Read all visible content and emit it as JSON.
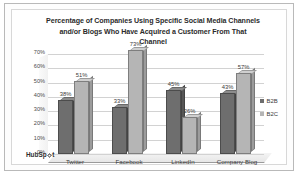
{
  "chart_data": {
    "type": "bar",
    "title": "Percentage of Companies Using Specific Social Media Channels and/or Blogs Who Have Acquired a Customer From That Channel",
    "title_lines": [
      "Percentage of Companies Using Specific Social Media Channels",
      "and/or Blogs Who Have Acquired a Customer From That",
      "Channel"
    ],
    "categories": [
      "Twitter",
      "Facebook",
      "LinkedIn",
      "Company Blog"
    ],
    "series": [
      {
        "name": "B2B",
        "values": [
          38,
          33,
          45,
          43
        ],
        "color": "#6e6e6e"
      },
      {
        "name": "B2C",
        "values": [
          51,
          73,
          26,
          57
        ],
        "color": "#b5b5b5"
      }
    ],
    "data_labels": [
      [
        "38%",
        "33%",
        "45%",
        "43%"
      ],
      [
        "51%",
        "73%",
        "26%",
        "57%"
      ]
    ],
    "xlabel": "",
    "ylabel": "",
    "ylim": [
      0,
      70
    ],
    "ytick_values": [
      0,
      10,
      20,
      30,
      40,
      50,
      60,
      70
    ],
    "ytick_labels": [
      "0%",
      "10%",
      "20%",
      "30%",
      "40%",
      "50%",
      "60%",
      "70%"
    ],
    "grid": true,
    "legend_position": "right",
    "style": "3d-clustered-column"
  },
  "branding": {
    "name": "HubSpot",
    "name_part1": "HubSp",
    "name_part2": "t",
    "sprocket_icon": "sprocket-icon"
  }
}
